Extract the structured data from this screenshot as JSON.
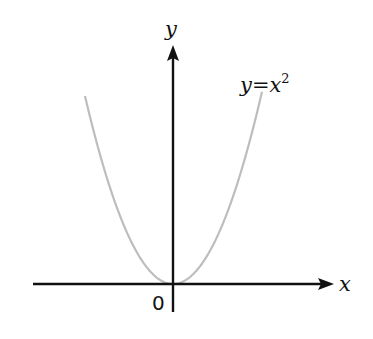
{
  "chart_data": {
    "type": "line",
    "title": "",
    "xlabel": "x",
    "ylabel": "y",
    "origin_label": "0",
    "series": [
      {
        "name": "y=x^2",
        "label": "y = x²",
        "function": "x^2",
        "x": [
          -3,
          -2,
          -1,
          0,
          1,
          2,
          3
        ],
        "values": [
          9,
          4,
          1,
          0,
          1,
          4,
          9
        ],
        "color": "#bdbdbd"
      }
    ],
    "axes_color": "#111111",
    "grid": false,
    "legend": "inline label near right branch"
  },
  "labels": {
    "x_axis": "x",
    "y_axis": "y",
    "origin": "0",
    "curve_y": "y",
    "curve_eq": "=",
    "curve_x": "x",
    "curve_exp": "2"
  }
}
